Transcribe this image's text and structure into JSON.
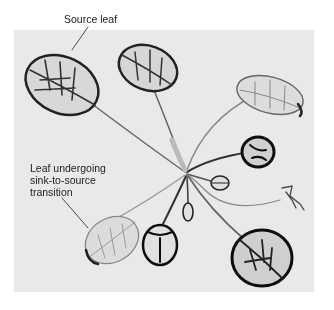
{
  "figure": {
    "labels": {
      "source_leaf": "Source leaf",
      "transition_leaf_line1": "Leaf undergoing",
      "transition_leaf_line2": "sink-to-source",
      "transition_leaf_line3": "transition"
    },
    "colors": {
      "background": "#ffffff",
      "photo_background": "#e9e9e9",
      "vein_dark": "#2a2a2a",
      "leaf_light": "#cfcfcf"
    }
  }
}
